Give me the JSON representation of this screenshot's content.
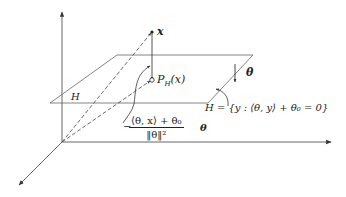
{
  "diagram": {
    "type": "3d-geometry",
    "colors": {
      "line": "#555555",
      "text": "#222222",
      "background": "#ffffff"
    },
    "labels": {
      "point_x": "x",
      "projection": "P",
      "projection_sub": "H",
      "projection_arg": "(x)",
      "plane_name": "H",
      "normal": "θ",
      "plane_def": "H = {y : ⟨θ, y⟩ + θ₀ = 0}",
      "offset_minus": "−",
      "offset_numerator": "⟨θ, x⟩ + θ₀",
      "offset_denominator": "‖θ‖²",
      "offset_vector": "θ"
    },
    "axes": [
      {
        "name": "vertical-axis",
        "from": [
          62,
          142
        ],
        "to": [
          62,
          12
        ]
      },
      {
        "name": "horizontal-axis",
        "from": [
          62,
          142
        ],
        "to": [
          331,
          142
        ]
      },
      {
        "name": "depth-axis",
        "from": [
          62,
          142
        ],
        "to": [
          19,
          185
        ]
      }
    ],
    "plane_corners": [
      [
        117,
        55
      ],
      [
        253,
        55
      ],
      [
        208,
        103
      ],
      [
        50,
        103
      ]
    ],
    "points": {
      "x": [
        152,
        32
      ],
      "projection": [
        152,
        80
      ],
      "origin": [
        62,
        142
      ]
    }
  }
}
